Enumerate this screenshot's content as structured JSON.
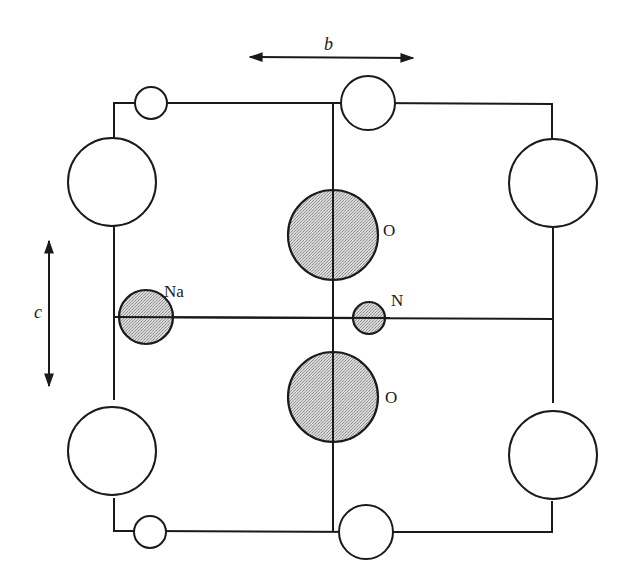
{
  "diagram": {
    "axes": {
      "b_label": "b",
      "c_label": "c"
    },
    "labels": {
      "sodium": "Na",
      "nitrogen": "N",
      "oxygen_upper": "O",
      "oxygen_lower": "O"
    },
    "colors": {
      "line": "#1a1a1a",
      "shaded_fill": "#c8c8c8",
      "background": "#ffffff"
    }
  }
}
